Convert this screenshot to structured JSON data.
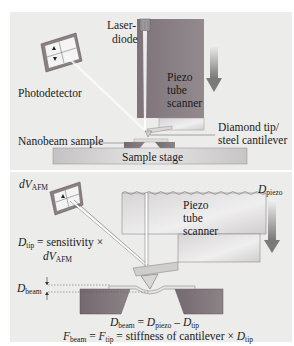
{
  "top_panel": {
    "laser_label_1": "Laser-",
    "laser_label_2": "diode",
    "piezo_label_1": "Piezo",
    "piezo_label_2": "tube",
    "piezo_label_3": "scanner",
    "photodetector_label": "Photodetector",
    "tip_label_1": "Diamond tip/",
    "tip_label_2": "steel cantilever",
    "sample_label": "Nanobeam sample",
    "stage_label": "Sample stage"
  },
  "bottom_panel": {
    "dv_var": "dV",
    "dv_sub": "AFM",
    "dpiezo_var": "D",
    "dpiezo_sub": "piezo",
    "piezo_label_1": "Piezo",
    "piezo_label_2": "tube",
    "piezo_label_3": "scanner",
    "dtip_var": "D",
    "dtip_sub": "tip",
    "dtip_eq": " = sensitivity ×",
    "dtip_dv_var": "dV",
    "dtip_dv_sub": "AFM",
    "dbeam_var": "D",
    "dbeam_sub": "beam",
    "eq1": {
      "lhs_var": "D",
      "lhs_sub": "beam",
      "eq": " = ",
      "t1_var": "D",
      "t1_sub": "piezo",
      "minus": " – ",
      "t2_var": "D",
      "t2_sub": "tip"
    },
    "eq2": {
      "lhs_var": "F",
      "lhs_sub": "beam",
      "eq1": " = ",
      "mid_var": "F",
      "mid_sub": "tip",
      "eq2": " = stiffness of cantilever × ",
      "t_var": "D",
      "t_sub": "tip"
    }
  },
  "colors": {
    "panel_bg": "#ececea",
    "scanner_dark": "#8a7f84",
    "scanner_light": "#d9d7d8",
    "stage": "#c8c6c7",
    "support": "#7e7478",
    "arrow": "#8c8c8c",
    "frame": "#8b8084"
  }
}
